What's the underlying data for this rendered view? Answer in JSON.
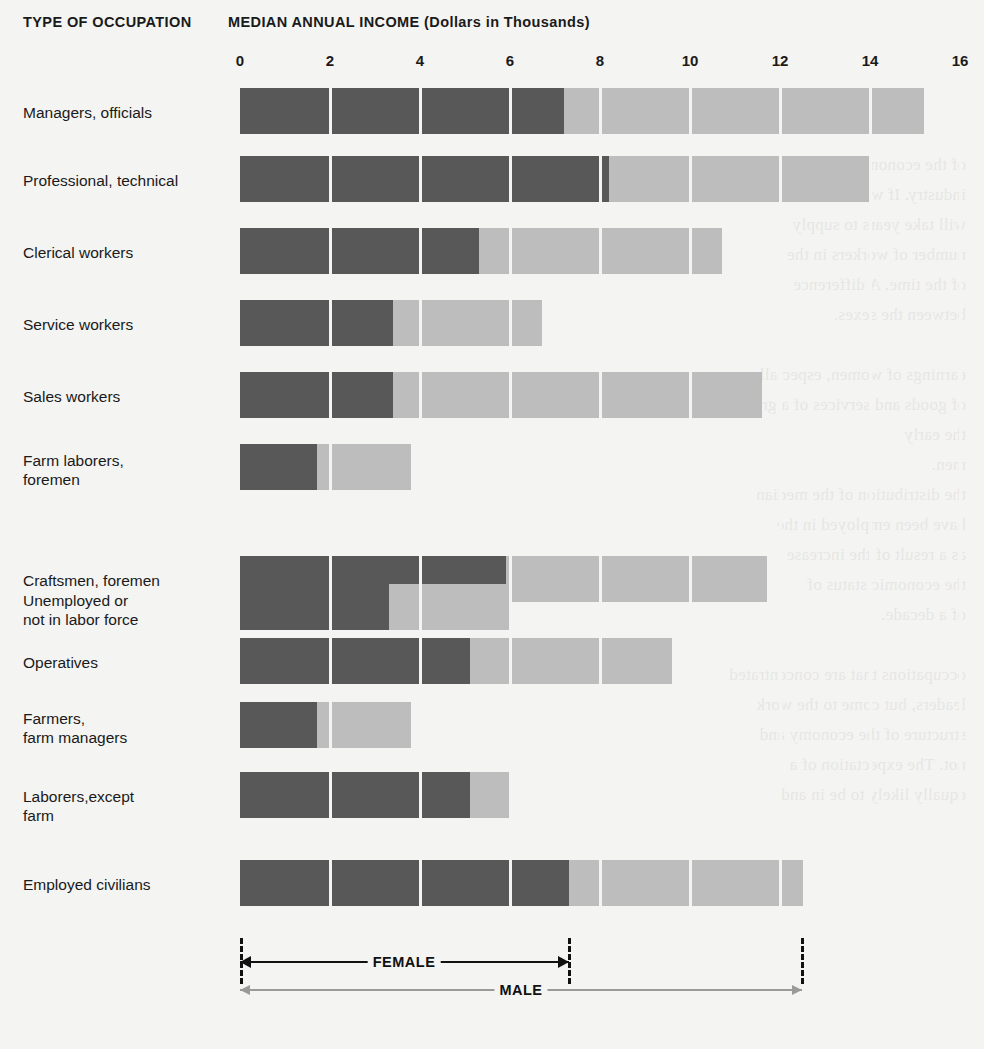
{
  "header": {
    "left_title": "TYPE OF OCCUPATION",
    "right_title": "MEDIAN ANNUAL INCOME (Dollars in Thousands)"
  },
  "legend": {
    "female_label": "FEMALE",
    "male_label": "MALE",
    "female_color": "#585858",
    "male_color": "#bdbdbd"
  },
  "ghost_text": "the reverse printed page shows through faintly",
  "chart_data": {
    "type": "bar",
    "orientation": "horizontal",
    "stacked": false,
    "overlay": true,
    "title": "MEDIAN ANNUAL INCOME (Dollars in Thousands)",
    "xlabel": "MEDIAN ANNUAL INCOME (Dollars in Thousands)",
    "ylabel": "TYPE OF OCCUPATION",
    "xlim": [
      0,
      16
    ],
    "xticks": [
      0,
      2,
      4,
      6,
      8,
      10,
      12,
      14,
      16
    ],
    "xtick_labels": [
      "0",
      "2",
      "4",
      "6",
      "8",
      "10",
      "12",
      "14",
      "16"
    ],
    "grid": true,
    "legend_position": "bottom",
    "units": "thousands of dollars",
    "categories": [
      "Managers, officials",
      "Professional, technical",
      "Clerical workers",
      "Service workers",
      "Sales workers",
      "Farm laborers,\nforemen",
      "Craftsmen, foremen",
      "Unemployed or\nnot in labor force",
      "Operatives",
      "Farmers,\nfarm managers",
      "Laborers,except\nfarm",
      "Employed civilians"
    ],
    "series": [
      {
        "name": "FEMALE",
        "color": "#585858",
        "values": [
          7.2,
          8.2,
          5.3,
          3.4,
          3.4,
          1.7,
          5.9,
          3.3,
          5.1,
          1.7,
          5.1,
          7.3
        ]
      },
      {
        "name": "MALE",
        "color": "#bdbdbd",
        "values": [
          15.2,
          14.0,
          10.7,
          6.7,
          11.6,
          3.8,
          11.7,
          6.0,
          9.6,
          3.8,
          6.0,
          12.5
        ]
      }
    ]
  }
}
